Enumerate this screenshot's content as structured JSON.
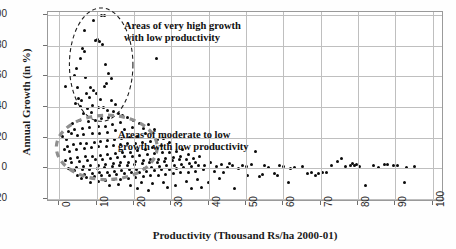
{
  "chart_data": {
    "type": "scatter",
    "title": "",
    "xlabel": "Productivity (Thousand Rs/ha 2000-01)",
    "ylabel": "Annual Growth (in %)",
    "xlim": [
      -3,
      103
    ],
    "ylim": [
      -22,
      102
    ],
    "xticks": [
      "0",
      "10",
      "20",
      "30",
      "40",
      "50",
      "60",
      "70",
      "80",
      "90",
      "100"
    ],
    "xtick_values": [
      0,
      10,
      20,
      30,
      40,
      50,
      60,
      70,
      80,
      90,
      100
    ],
    "yticks": [
      "100",
      "80",
      "60",
      "40",
      "20",
      "0",
      "-20"
    ],
    "ytick_values": [
      100,
      80,
      60,
      40,
      20,
      0,
      -20
    ],
    "grid": true,
    "legend": "none",
    "marker_color": "#0a0a0a",
    "grid_color": "#bfbfbf",
    "frame_color": "#9a9a9a",
    "annotations": [
      {
        "id": "high-growth",
        "text": "Areas  of  very high growth\nwith low productivity",
        "x": 24,
        "y": 93
      },
      {
        "id": "moderate-growth",
        "text": "Areas of moderate to low\ngrowth with low productivity",
        "x": 22,
        "y": 34
      }
    ],
    "highlight_regions": [
      {
        "id": "very-high-growth-ellipse",
        "style": "dashed",
        "color": "#1c1c1c",
        "cx": 11.5,
        "cy": 67,
        "rx": 8.5,
        "ry": 37
      },
      {
        "id": "moderate-low-growth-ellipse",
        "style": "dashed",
        "color": "#8f8f8f",
        "cx": 13,
        "cy": 13,
        "rx": 13.5,
        "ry": 21
      }
    ],
    "points": [
      [
        11.4,
        100.0
      ],
      [
        9.2,
        96.5
      ],
      [
        12.0,
        99.5
      ],
      [
        6.9,
        90.0
      ],
      [
        9.6,
        83.5
      ],
      [
        10.2,
        84.0
      ],
      [
        10.8,
        83.0
      ],
      [
        11.6,
        81.0
      ],
      [
        6.3,
        78.5
      ],
      [
        6.8,
        76.5
      ],
      [
        5.6,
        71.5
      ],
      [
        26.0,
        71.5
      ],
      [
        12.3,
        68.0
      ],
      [
        4.6,
        65.0
      ],
      [
        4.2,
        60.5
      ],
      [
        7.0,
        59.5
      ],
      [
        13.3,
        62.0
      ],
      [
        14.0,
        58.5
      ],
      [
        12.6,
        55.5
      ],
      [
        12.2,
        53.5
      ],
      [
        1.6,
        53.5
      ],
      [
        4.9,
        52.5
      ],
      [
        8.5,
        52.5
      ],
      [
        9.3,
        50.5
      ],
      [
        7.2,
        49.0
      ],
      [
        10.0,
        48.5
      ],
      [
        8.0,
        46.0
      ],
      [
        5.2,
        45.5
      ],
      [
        6.0,
        44.0
      ],
      [
        11.0,
        45.0
      ],
      [
        13.9,
        44.0
      ],
      [
        15.2,
        41.5
      ],
      [
        9.0,
        41.0
      ],
      [
        10.6,
        40.0
      ],
      [
        11.9,
        39.5
      ],
      [
        7.6,
        39.0
      ],
      [
        4.4,
        42.0
      ],
      [
        5.8,
        40.5
      ],
      [
        12.9,
        37.5
      ],
      [
        14.5,
        37.0
      ],
      [
        8.6,
        36.5
      ],
      [
        6.4,
        35.5
      ],
      [
        17.0,
        34.5
      ],
      [
        18.2,
        33.0
      ],
      [
        15.8,
        35.5
      ],
      [
        13.2,
        33.0
      ],
      [
        11.2,
        32.5
      ],
      [
        9.8,
        31.5
      ],
      [
        7.8,
        30.5
      ],
      [
        5.4,
        31.0
      ],
      [
        3.6,
        29.5
      ],
      [
        20.0,
        31.5
      ],
      [
        21.5,
        29.0
      ],
      [
        16.5,
        30.0
      ],
      [
        14.2,
        28.5
      ],
      [
        12.4,
        27.5
      ],
      [
        10.4,
        27.0
      ],
      [
        8.2,
        26.5
      ],
      [
        6.2,
        26.0
      ],
      [
        4.0,
        25.5
      ],
      [
        2.4,
        24.0
      ],
      [
        1.0,
        20.5
      ],
      [
        2.0,
        19.0
      ],
      [
        3.2,
        22.5
      ],
      [
        4.8,
        21.5
      ],
      [
        6.6,
        22.0
      ],
      [
        8.8,
        23.0
      ],
      [
        10.9,
        22.5
      ],
      [
        13.0,
        23.5
      ],
      [
        15.0,
        24.5
      ],
      [
        17.5,
        25.0
      ],
      [
        19.5,
        26.5
      ],
      [
        22.5,
        26.0
      ],
      [
        24.0,
        28.5
      ],
      [
        25.5,
        25.5
      ],
      [
        23.0,
        22.5
      ],
      [
        21.0,
        21.0
      ],
      [
        18.8,
        20.0
      ],
      [
        16.8,
        19.5
      ],
      [
        14.8,
        18.5
      ],
      [
        12.8,
        18.0
      ],
      [
        11.0,
        17.5
      ],
      [
        9.4,
        17.0
      ],
      [
        7.4,
        16.5
      ],
      [
        5.6,
        16.0
      ],
      [
        3.8,
        15.5
      ],
      [
        2.2,
        14.5
      ],
      [
        1.4,
        12.0
      ],
      [
        2.8,
        11.0
      ],
      [
        4.6,
        12.5
      ],
      [
        6.8,
        13.0
      ],
      [
        8.6,
        13.5
      ],
      [
        10.6,
        14.0
      ],
      [
        12.6,
        14.5
      ],
      [
        14.6,
        15.0
      ],
      [
        16.4,
        15.5
      ],
      [
        18.4,
        16.0
      ],
      [
        20.4,
        16.5
      ],
      [
        22.4,
        17.0
      ],
      [
        24.4,
        17.5
      ],
      [
        26.4,
        18.5
      ],
      [
        28.0,
        19.5
      ],
      [
        29.5,
        17.0
      ],
      [
        27.5,
        15.0
      ],
      [
        25.0,
        13.5
      ],
      [
        23.0,
        12.5
      ],
      [
        21.0,
        11.5
      ],
      [
        19.0,
        10.5
      ],
      [
        17.0,
        10.0
      ],
      [
        15.0,
        9.5
      ],
      [
        13.0,
        9.0
      ],
      [
        11.0,
        8.5
      ],
      [
        9.0,
        8.0
      ],
      [
        7.0,
        7.5
      ],
      [
        5.0,
        7.0
      ],
      [
        3.0,
        6.5
      ],
      [
        1.8,
        5.0
      ],
      [
        3.4,
        4.0
      ],
      [
        5.4,
        4.5
      ],
      [
        7.6,
        5.0
      ],
      [
        9.6,
        5.5
      ],
      [
        11.6,
        6.0
      ],
      [
        13.6,
        6.5
      ],
      [
        15.6,
        7.0
      ],
      [
        17.6,
        7.5
      ],
      [
        19.6,
        8.0
      ],
      [
        21.6,
        8.5
      ],
      [
        23.6,
        9.0
      ],
      [
        25.6,
        9.5
      ],
      [
        27.6,
        10.0
      ],
      [
        29.6,
        10.5
      ],
      [
        31.5,
        11.0
      ],
      [
        33.0,
        12.5
      ],
      [
        34.5,
        9.0
      ],
      [
        32.5,
        8.0
      ],
      [
        30.5,
        7.0
      ],
      [
        28.5,
        6.5
      ],
      [
        26.5,
        6.0
      ],
      [
        24.5,
        5.5
      ],
      [
        22.5,
        5.0
      ],
      [
        20.5,
        4.5
      ],
      [
        18.5,
        4.0
      ],
      [
        16.5,
        3.5
      ],
      [
        14.5,
        3.0
      ],
      [
        12.5,
        2.5
      ],
      [
        10.5,
        2.0
      ],
      [
        8.5,
        1.5
      ],
      [
        6.5,
        1.0
      ],
      [
        4.5,
        0.5
      ],
      [
        2.6,
        0.0
      ],
      [
        4.2,
        -1.5
      ],
      [
        6.2,
        -1.0
      ],
      [
        8.2,
        -0.5
      ],
      [
        10.2,
        0.0
      ],
      [
        12.2,
        0.5
      ],
      [
        14.2,
        1.0
      ],
      [
        16.2,
        1.5
      ],
      [
        18.2,
        2.0
      ],
      [
        20.2,
        2.5
      ],
      [
        22.2,
        3.0
      ],
      [
        24.2,
        3.5
      ],
      [
        26.2,
        4.0
      ],
      [
        28.2,
        4.5
      ],
      [
        30.2,
        5.0
      ],
      [
        32.2,
        5.5
      ],
      [
        34.2,
        6.0
      ],
      [
        36.0,
        6.5
      ],
      [
        37.5,
        8.0
      ],
      [
        36.5,
        4.0
      ],
      [
        34.8,
        3.0
      ],
      [
        32.8,
        2.5
      ],
      [
        30.8,
        2.0
      ],
      [
        28.8,
        1.5
      ],
      [
        26.8,
        1.0
      ],
      [
        24.8,
        0.5
      ],
      [
        22.8,
        0.0
      ],
      [
        20.8,
        -0.5
      ],
      [
        18.8,
        -1.0
      ],
      [
        16.8,
        -1.5
      ],
      [
        14.8,
        -2.0
      ],
      [
        12.8,
        -2.5
      ],
      [
        10.8,
        -3.0
      ],
      [
        8.8,
        -3.5
      ],
      [
        6.8,
        -4.0
      ],
      [
        5.0,
        -5.0
      ],
      [
        7.2,
        -6.0
      ],
      [
        9.4,
        -5.5
      ],
      [
        11.4,
        -5.0
      ],
      [
        13.4,
        -4.5
      ],
      [
        15.4,
        -4.0
      ],
      [
        17.4,
        -3.5
      ],
      [
        19.4,
        -3.0
      ],
      [
        21.4,
        -2.5
      ],
      [
        23.4,
        -2.0
      ],
      [
        25.4,
        -1.5
      ],
      [
        27.4,
        -1.0
      ],
      [
        29.4,
        -0.5
      ],
      [
        31.4,
        0.0
      ],
      [
        33.4,
        0.5
      ],
      [
        35.4,
        1.0
      ],
      [
        37.4,
        1.5
      ],
      [
        39.0,
        2.0
      ],
      [
        40.5,
        3.5
      ],
      [
        38.5,
        -1.0
      ],
      [
        36.5,
        -2.0
      ],
      [
        34.5,
        -2.5
      ],
      [
        32.5,
        -3.0
      ],
      [
        30.5,
        -3.5
      ],
      [
        28.5,
        -4.0
      ],
      [
        26.5,
        -4.5
      ],
      [
        24.5,
        -5.0
      ],
      [
        22.5,
        -5.5
      ],
      [
        20.5,
        -6.0
      ],
      [
        18.5,
        -6.5
      ],
      [
        16.5,
        -7.0
      ],
      [
        14.5,
        -7.5
      ],
      [
        12.5,
        -8.0
      ],
      [
        10.5,
        -8.5
      ],
      [
        16.0,
        -10.5
      ],
      [
        19.0,
        -11.0
      ],
      [
        22.0,
        -9.5
      ],
      [
        25.0,
        -10.0
      ],
      [
        28.0,
        -9.0
      ],
      [
        31.0,
        -11.5
      ],
      [
        21.0,
        -13.0
      ],
      [
        34.0,
        -8.5
      ],
      [
        37.0,
        -7.5
      ],
      [
        40.0,
        -9.5
      ],
      [
        42.0,
        1.0
      ],
      [
        43.5,
        2.5
      ],
      [
        45.0,
        0.5
      ],
      [
        44.0,
        -3.0
      ],
      [
        46.5,
        1.5
      ],
      [
        48.0,
        0.0
      ],
      [
        47.0,
        -13.5
      ],
      [
        50.0,
        1.0
      ],
      [
        51.5,
        2.5
      ],
      [
        50.5,
        -4.5
      ],
      [
        52.5,
        11.0
      ],
      [
        53.5,
        -5.5
      ],
      [
        54.5,
        -4.0
      ],
      [
        56.0,
        0.5
      ],
      [
        57.5,
        -3.5
      ],
      [
        58.5,
        -4.5
      ],
      [
        60.0,
        1.0
      ],
      [
        61.5,
        -9.5
      ],
      [
        63.0,
        0.5
      ],
      [
        65.0,
        1.0
      ],
      [
        66.5,
        -3.5
      ],
      [
        67.5,
        -3.0
      ],
      [
        68.5,
        -4.5
      ],
      [
        69.5,
        -3.5
      ],
      [
        70.5,
        -2.5
      ],
      [
        71.5,
        -3.0
      ],
      [
        73.0,
        2.0
      ],
      [
        74.5,
        4.5
      ],
      [
        75.5,
        6.5
      ],
      [
        76.5,
        1.0
      ],
      [
        78.0,
        2.0
      ],
      [
        78.5,
        3.0
      ],
      [
        79.0,
        1.5
      ],
      [
        79.5,
        2.5
      ],
      [
        80.5,
        1.0
      ],
      [
        82.0,
        -11.0
      ],
      [
        84.0,
        1.5
      ],
      [
        85.5,
        0.5
      ],
      [
        87.0,
        2.5
      ],
      [
        88.0,
        2.5
      ],
      [
        89.5,
        2.0
      ],
      [
        90.5,
        2.0
      ],
      [
        93.0,
        0.5
      ],
      [
        95.0,
        1.0
      ],
      [
        92.5,
        -9.0
      ],
      [
        62.0,
        0.0
      ],
      [
        59.0,
        2.0
      ],
      [
        55.0,
        1.5
      ],
      [
        49.0,
        2.0
      ],
      [
        45.5,
        3.0
      ],
      [
        41.5,
        -2.0
      ],
      [
        43.0,
        -6.5
      ],
      [
        38.0,
        -12.5
      ],
      [
        24.0,
        -14.5
      ],
      [
        13.5,
        -11.5
      ],
      [
        8.5,
        -9.5
      ],
      [
        6.0,
        -6.5
      ],
      [
        35.5,
        -13.5
      ],
      [
        29.0,
        -12.5
      ]
    ]
  }
}
